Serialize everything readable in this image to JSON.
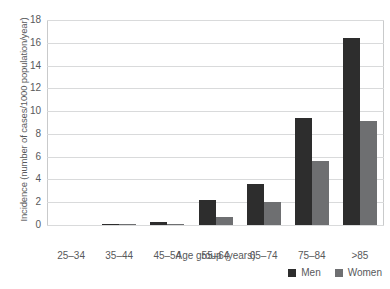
{
  "chart_data": {
    "type": "bar",
    "title": "",
    "xlabel": "Age group (years)",
    "ylabel": "Incidence (number of cases/1000 population/year)",
    "categories": [
      "25–34",
      "35–44",
      "45–54",
      "55–64",
      "65–74",
      "75–84",
      ">85"
    ],
    "series": [
      {
        "name": "Men",
        "color": "#2d2d2d",
        "values": [
          0,
          0.1,
          0.25,
          2.2,
          3.6,
          9.4,
          16.4
        ]
      },
      {
        "name": "Women",
        "color": "#6e6f71",
        "values": [
          0,
          0.05,
          0.05,
          0.7,
          2.0,
          5.6,
          9.1
        ]
      }
    ],
    "ylim": [
      0,
      18
    ],
    "yticks": [
      0,
      2,
      4,
      6,
      8,
      10,
      12,
      14,
      16,
      18
    ],
    "ytick_labels": [
      "0",
      "2",
      "4",
      "6",
      "8",
      "10",
      "12",
      "14",
      "16",
      "18"
    ],
    "grid": true,
    "legend_position": "bottom-right"
  },
  "legend": {
    "entries": [
      {
        "label": "Men",
        "color": "#2d2d2d"
      },
      {
        "label": "Women",
        "color": "#6e6f71"
      }
    ]
  }
}
